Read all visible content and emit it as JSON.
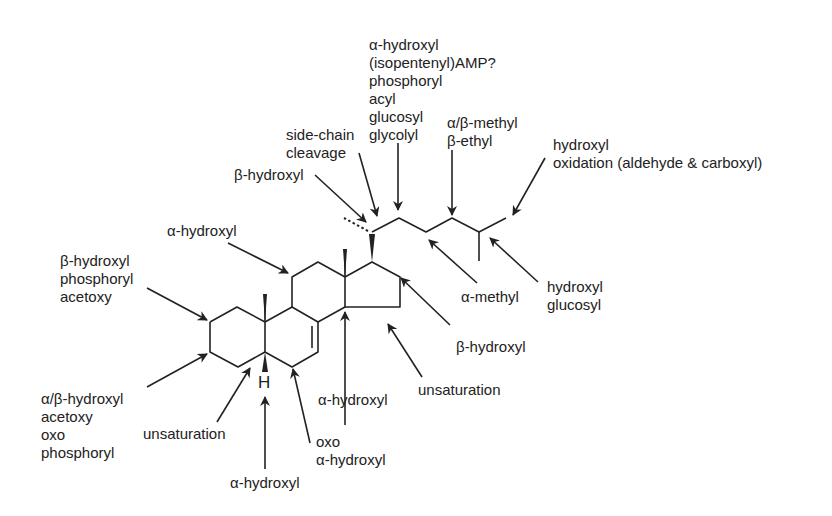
{
  "diagram": {
    "type": "steroid structure with modification sites",
    "colors": {
      "ink": "#222222",
      "background": "#ffffff"
    },
    "ring_labels": {
      "h5": "H"
    },
    "annotations": [
      {
        "id": "c22",
        "lines": [
          "α-hydroxyl",
          "(isopentenyl)AMP?",
          "phosphoryl",
          "acyl",
          "glucosyl",
          "glycolyl"
        ]
      },
      {
        "id": "c20_cleavage",
        "lines": [
          "side-chain",
          "cleavage"
        ]
      },
      {
        "id": "c24",
        "lines": [
          "α/β-methyl",
          "β-ethyl"
        ]
      },
      {
        "id": "c26",
        "lines": [
          "hydroxyl",
          "oxidation (aldehyde & carboxyl)"
        ]
      },
      {
        "id": "c20",
        "lines": [
          "β-hydroxyl"
        ]
      },
      {
        "id": "c11",
        "lines": [
          "α-hydroxyl"
        ]
      },
      {
        "id": "c3",
        "lines": [
          "β-hydroxyl",
          "phosphoryl",
          "acetoxy"
        ]
      },
      {
        "id": "c2",
        "lines": [
          "α/β-hydroxyl",
          "acetoxy",
          "oxo",
          "phosphoryl"
        ]
      },
      {
        "id": "c4",
        "lines": [
          "unsaturation"
        ]
      },
      {
        "id": "c5",
        "lines": [
          "α-hydroxyl"
        ]
      },
      {
        "id": "c6",
        "lines": [
          "oxo",
          "α-hydroxyl"
        ]
      },
      {
        "id": "c14",
        "lines": [
          "α-hydroxyl"
        ]
      },
      {
        "id": "c15",
        "lines": [
          "unsaturation"
        ]
      },
      {
        "id": "c16",
        "lines": [
          "β-hydroxyl"
        ]
      },
      {
        "id": "c23",
        "lines": [
          "α-methyl"
        ]
      },
      {
        "id": "c25",
        "lines": [
          "hydroxyl",
          "glucosyl"
        ]
      }
    ]
  }
}
